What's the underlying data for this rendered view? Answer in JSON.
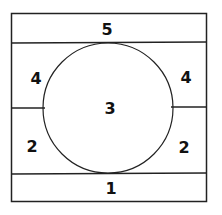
{
  "diagram": {
    "labels": {
      "top": "5",
      "upper_left": "4",
      "upper_right": "4",
      "center": "3",
      "lower_left": "2",
      "lower_right": "2",
      "bottom": "1"
    },
    "colors": {
      "stroke": "#222222",
      "background": "#ffffff",
      "text": "#111111"
    }
  }
}
